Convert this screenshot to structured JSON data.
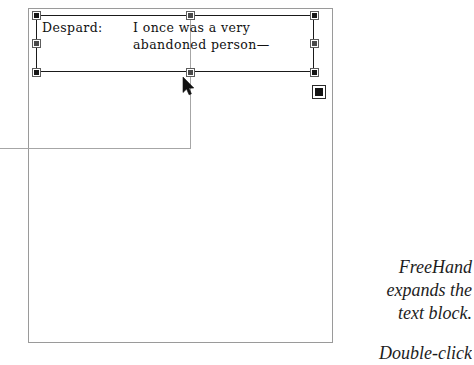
{
  "app": {
    "name": "FreeHand",
    "background_color": "#ffffff",
    "page_border_color": "#9a9a9a",
    "guide_color": "#a6a6a6",
    "handle_color": "#161616",
    "text_color": "#111111"
  },
  "document": {
    "page_label": "page-canvas"
  },
  "text_block": {
    "speaker": "Despard:",
    "line1": "I once was a very",
    "line2": "abandoned person—",
    "selected": true,
    "handles": [
      {
        "name": "handle-top-left",
        "position": "top-left"
      },
      {
        "name": "handle-top-center",
        "position": "top-center"
      },
      {
        "name": "handle-top-right",
        "position": "top-right"
      },
      {
        "name": "handle-middle-left",
        "position": "middle-left"
      },
      {
        "name": "handle-middle-right",
        "position": "middle-right"
      },
      {
        "name": "handle-bottom-left",
        "position": "bottom-left"
      },
      {
        "name": "handle-bottom-center",
        "position": "bottom-center"
      },
      {
        "name": "handle-bottom-right",
        "position": "bottom-right"
      }
    ],
    "link_indicator": {
      "name": "text-block-link-box",
      "state": "filled"
    }
  },
  "guides": {
    "horizontal_label": "drag-guide-horizontal",
    "vertical_label": "drag-guide-vertical"
  },
  "cursor": {
    "type": "arrow-pointer"
  },
  "caption": {
    "line1": "FreeHand",
    "line2": "expands the",
    "line3": "text block.",
    "next_line": "Double-click"
  }
}
